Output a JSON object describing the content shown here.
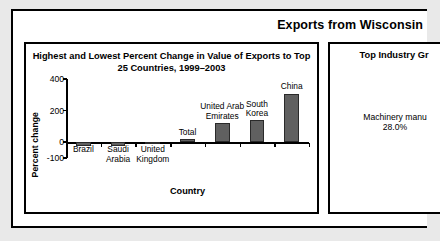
{
  "header": {
    "title": "Exports from Wisconsin"
  },
  "chart_panel": {
    "title": "Highest and Lowest Percent Change in Value\nof Exports to Top 25 Countries, 1999–2003"
  },
  "industry_panel": {
    "title": "Top Industry Gr",
    "entry_name": "Machinery manu",
    "entry_value": "28.0%"
  },
  "chart_data": {
    "type": "bar",
    "title": "Highest and Lowest Percent Change in Value of Exports to Top 25 Countries, 1999–2003",
    "xlabel": "Country",
    "ylabel": "Percent change",
    "categories": [
      "Brazil",
      "Saudi\nArabia",
      "United\nKingdom",
      "Total",
      "United Arab\nEmirates",
      "South\nKorea",
      "China"
    ],
    "values": [
      -25,
      -25,
      -12,
      18,
      120,
      138,
      306
    ],
    "ylim": [
      -100,
      400
    ],
    "yticks": [
      400,
      200,
      0,
      -100
    ],
    "ytick_labels": [
      "400",
      "200",
      "0",
      "-100"
    ],
    "grid": false,
    "legend": "none",
    "bar_color": "#606060"
  }
}
